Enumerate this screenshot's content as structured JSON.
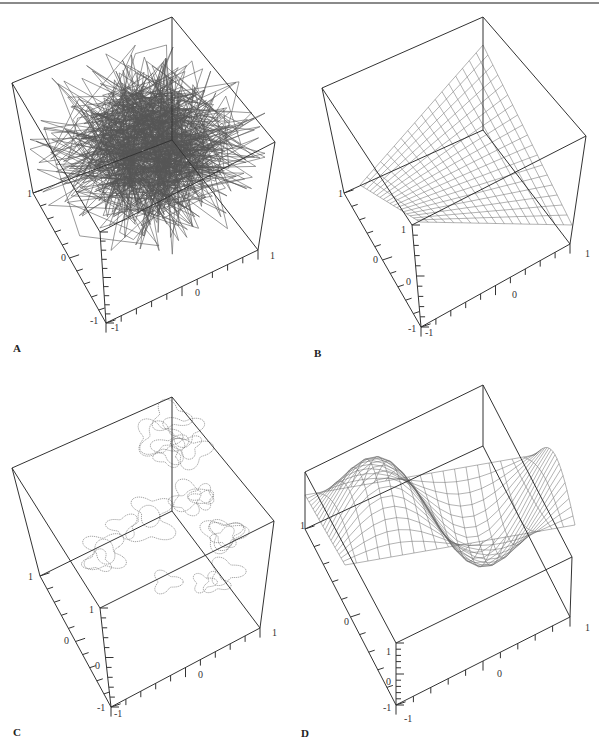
{
  "figure": {
    "panels": [
      {
        "id": "A",
        "label": "A",
        "content": "random 3D polyline (dense tangle)",
        "axis_ticks": {
          "left_axis": [
            "1",
            "0",
            "-1"
          ],
          "front_vertical": [
            "-1"
          ],
          "bottom_axis": [
            "-1",
            "0",
            "1"
          ]
        }
      },
      {
        "id": "B",
        "label": "B",
        "content": "saddle-like wireframe surface (triangular sheet)",
        "axis_ticks": {
          "left_axis": [
            "1",
            "0"
          ],
          "front_vertical": [
            "1",
            "0",
            "-1"
          ],
          "bottom_axis": [
            "-1",
            "0",
            "1"
          ]
        }
      },
      {
        "id": "C",
        "label": "C",
        "content": "level-set contour curves on tilted plane",
        "axis_ticks": {
          "left_axis": [
            "1",
            "0"
          ],
          "front_vertical": [
            "1",
            "0",
            "-1"
          ],
          "bottom_axis": [
            "-1",
            "0",
            "1"
          ]
        }
      },
      {
        "id": "D",
        "label": "D",
        "content": "oscillating wireframe surface with twisted folds",
        "axis_ticks": {
          "left_axis": [
            "1",
            "0"
          ],
          "front_vertical": [
            "1",
            "0",
            "-1"
          ],
          "bottom_axis": [
            "-1",
            "0",
            "1"
          ]
        }
      }
    ]
  },
  "colors": {
    "box": "#333333",
    "mesh": "#555555",
    "rule": "#8a8a8a"
  }
}
